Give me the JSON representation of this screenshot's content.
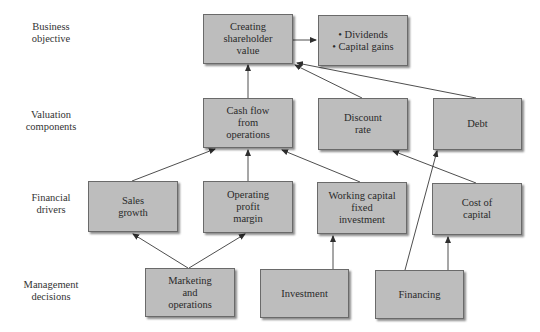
{
  "row_labels": [
    {
      "line1": "Business",
      "line2": "objective"
    },
    {
      "line1": "Valuation",
      "line2": "components"
    },
    {
      "line1": "Financial",
      "line2": "drivers"
    },
    {
      "line1": "Management",
      "line2": "decisions"
    }
  ],
  "nodes": {
    "creating_shareholder_value": {
      "lines": [
        "Creating",
        "shareholder",
        "value"
      ]
    },
    "dividends_capital_gains": {
      "lines": [
        "• Dividends",
        "• Capital gains"
      ]
    },
    "cash_flow_from_operations": {
      "lines": [
        "Cash flow",
        "from",
        "operations"
      ]
    },
    "discount_rate": {
      "lines": [
        "Discount",
        "rate"
      ]
    },
    "debt": {
      "lines": [
        "Debt"
      ]
    },
    "sales_growth": {
      "lines": [
        "Sales",
        "growth"
      ]
    },
    "operating_profit_margin": {
      "lines": [
        "Operating",
        "profit",
        "margin"
      ]
    },
    "working_capital_fixed_investment": {
      "lines": [
        "Working capital",
        "fixed",
        "investment"
      ]
    },
    "cost_of_capital": {
      "lines": [
        "Cost of",
        "capital"
      ]
    },
    "marketing_and_operations": {
      "lines": [
        "Marketing",
        "and",
        "operations"
      ]
    },
    "investment": {
      "lines": [
        "Investment"
      ]
    },
    "financing": {
      "lines": [
        "Financing"
      ]
    }
  },
  "edges": [
    {
      "from": "creating_shareholder_value",
      "to": "dividends_capital_gains"
    },
    {
      "from": "cash_flow_from_operations",
      "to": "creating_shareholder_value"
    },
    {
      "from": "discount_rate",
      "to": "creating_shareholder_value"
    },
    {
      "from": "debt",
      "to": "creating_shareholder_value"
    },
    {
      "from": "sales_growth",
      "to": "cash_flow_from_operations"
    },
    {
      "from": "operating_profit_margin",
      "to": "cash_flow_from_operations"
    },
    {
      "from": "working_capital_fixed_investment",
      "to": "cash_flow_from_operations"
    },
    {
      "from": "cost_of_capital",
      "to": "discount_rate"
    },
    {
      "from": "marketing_and_operations",
      "to": "sales_growth"
    },
    {
      "from": "marketing_and_operations",
      "to": "operating_profit_margin"
    },
    {
      "from": "investment",
      "to": "working_capital_fixed_investment"
    },
    {
      "from": "financing",
      "to": "debt"
    },
    {
      "from": "financing",
      "to": "cost_of_capital"
    }
  ],
  "colors": {
    "box_fill": "#bdbdbd",
    "box_border": "#6a6a6a",
    "arrow": "#3a3a3a"
  }
}
